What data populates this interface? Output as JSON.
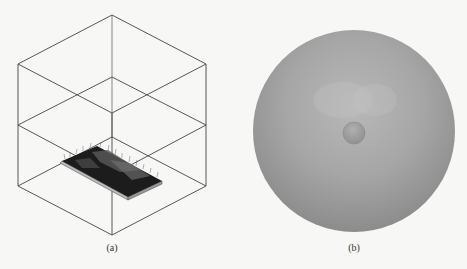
{
  "figure": {
    "panels": [
      {
        "id": "a",
        "caption": "(a)",
        "description": "Isometric wireframe cube split by a mid horizontal plane, with a dark textured terrain slab on the bottom face",
        "line_color": "#444444",
        "slab_color": "#1a1a1a"
      },
      {
        "id": "b",
        "caption": "(b)",
        "description": "Large shaded grey sphere with a small sphere at its center",
        "sphere_color": "#a3a3a3",
        "inner_sphere_color": "#9a9a9a"
      }
    ]
  }
}
